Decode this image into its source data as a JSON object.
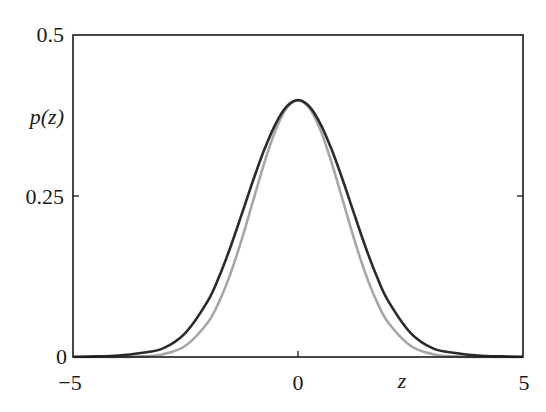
{
  "chart_data": {
    "type": "line",
    "title": "",
    "xlabel": "z",
    "ylabel": "p(z)",
    "xlim": [
      -5,
      5
    ],
    "ylim": [
      0,
      0.5
    ],
    "grid": false,
    "legend": null,
    "x_ticks": [
      {
        "value": -5,
        "label": "−5"
      },
      {
        "value": 0,
        "label": "0"
      },
      {
        "value": 5,
        "label": "5"
      }
    ],
    "y_ticks": [
      {
        "value": 0,
        "label": "0"
      },
      {
        "value": 0.25,
        "label": "0.25"
      },
      {
        "value": 0.5,
        "label": "0.5"
      }
    ],
    "x": [
      -5,
      -4.5,
      -4,
      -3.5,
      -3,
      -2.5,
      -2,
      -1.75,
      -1.5,
      -1.25,
      -1,
      -0.75,
      -0.5,
      -0.25,
      0,
      0.25,
      0.5,
      0.75,
      1,
      1.25,
      1.5,
      1.75,
      2,
      2.5,
      3,
      3.5,
      4,
      4.5,
      5
    ],
    "series": [
      {
        "name": "dark-curve",
        "color": "#2b2b2b",
        "values": [
          0.0003,
          0.0009,
          0.0024,
          0.0063,
          0.0134,
          0.0376,
          0.0876,
          0.1252,
          0.1709,
          0.2218,
          0.2737,
          0.3217,
          0.3617,
          0.389,
          0.3989,
          0.389,
          0.3617,
          0.3217,
          0.2737,
          0.2218,
          0.1709,
          0.1252,
          0.0876,
          0.0376,
          0.0134,
          0.0063,
          0.0024,
          0.0009,
          0.0003
        ]
      },
      {
        "name": "gray-curve",
        "color": "#a6a6a6",
        "values": [
          0.0,
          0.0,
          0.0001,
          0.0009,
          0.0044,
          0.0175,
          0.054,
          0.0863,
          0.1295,
          0.1826,
          0.242,
          0.3011,
          0.3521,
          0.3867,
          0.3989,
          0.3867,
          0.3521,
          0.3011,
          0.242,
          0.1826,
          0.1295,
          0.0863,
          0.054,
          0.0175,
          0.0044,
          0.0009,
          0.0001,
          0.0,
          0.0
        ]
      }
    ]
  },
  "labels": {
    "ylabel": "p(z)",
    "xlabel": "z",
    "y_top": "0.5",
    "y_mid": "0.25",
    "y_bottom": "0",
    "x_left": "−5",
    "x_mid": "0",
    "x_right": "5"
  }
}
